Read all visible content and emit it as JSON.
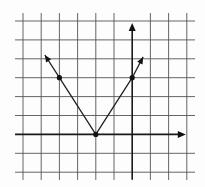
{
  "chart_data": {
    "type": "line",
    "title": "",
    "xlabel": "",
    "ylabel": "",
    "grid": true,
    "legend": "none",
    "xlim": [
      -6,
      3
    ],
    "ylim": [
      -2,
      6
    ],
    "x_ticks": [
      -6,
      -5,
      -4,
      -3,
      -2,
      -1,
      0,
      1,
      2,
      3
    ],
    "y_ticks": [
      -2,
      -1,
      0,
      1,
      2,
      3,
      4,
      5,
      6
    ],
    "tick_labels_shown": false,
    "function": "y = 1.5|x + 2|",
    "series": [
      {
        "name": "left-branch",
        "points": [
          [
            -2,
            0
          ],
          [
            -4,
            3
          ],
          [
            -4.8,
            4.2
          ]
        ],
        "arrow_end": true
      },
      {
        "name": "right-branch",
        "points": [
          [
            -2,
            0
          ],
          [
            0,
            3
          ],
          [
            0.6,
            4.1
          ]
        ],
        "arrow_end": true
      }
    ],
    "marked_points": [
      [
        -4,
        3
      ],
      [
        -2,
        0
      ],
      [
        0,
        3
      ]
    ],
    "axes": {
      "x_axis_arrow": "positive",
      "y_axis_arrow": "positive",
      "x_axis_extent": [
        -6,
        3
      ],
      "y_axis_extent": [
        -2.4,
        5.9
      ]
    }
  }
}
